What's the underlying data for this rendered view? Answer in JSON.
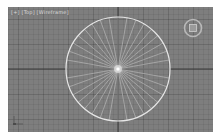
{
  "viewport": {
    "label": "[+] [Top] [Wireframe]",
    "view": "Top",
    "shading": "Wireframe",
    "background_color": "#7e7e7e",
    "axis_color": "#3a3a3a"
  },
  "object": {
    "type": "disk-wireframe",
    "center": [
      110,
      62
    ],
    "radius": 52,
    "spokes": 36,
    "edge_color": "#e6e6e6",
    "spoke_color": "#d0d0d0",
    "pivot_color": "#ffffff"
  },
  "viewcube": {
    "icon": "viewcube-top-icon",
    "face": "Top"
  },
  "axis_tripod": {
    "icon": "axis-tripod-icon"
  }
}
